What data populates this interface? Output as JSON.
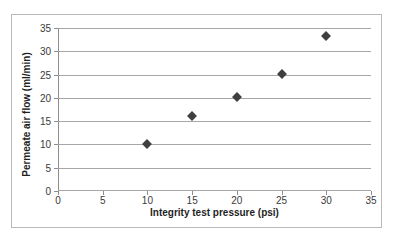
{
  "chart_data": {
    "type": "scatter",
    "title": "",
    "xlabel": "Integrity test pressure (psi)",
    "ylabel": "Permeate air flow (ml/min)",
    "x": [
      10,
      15,
      20,
      25,
      30
    ],
    "values": [
      10.0,
      16.1,
      20.2,
      25.2,
      33.3
    ],
    "series": [
      {
        "name": "",
        "points": [
          {
            "x": 10,
            "y": 10.0
          },
          {
            "x": 15,
            "y": 16.1
          },
          {
            "x": 20,
            "y": 20.2
          },
          {
            "x": 25,
            "y": 25.2
          },
          {
            "x": 30,
            "y": 33.3
          }
        ]
      }
    ],
    "xlim": [
      0,
      35
    ],
    "ylim": [
      0,
      35
    ],
    "xticks": [
      0,
      5,
      10,
      15,
      20,
      25,
      30,
      35
    ],
    "yticks": [
      0,
      5,
      10,
      15,
      20,
      25,
      30,
      35
    ],
    "xtick_labels": [
      "0",
      "5",
      "10",
      "15",
      "20",
      "25",
      "30",
      "35"
    ],
    "ytick_labels": [
      "0",
      "5",
      "10",
      "15",
      "20",
      "25",
      "30",
      "35"
    ],
    "grid": "horizontal",
    "legend": "none",
    "marker": "diamond",
    "marker_color": "#3f3f3f",
    "gridline_color": "#a6a6a6",
    "plot_background": "#ffffff",
    "border_color": "#b9b9b9"
  }
}
